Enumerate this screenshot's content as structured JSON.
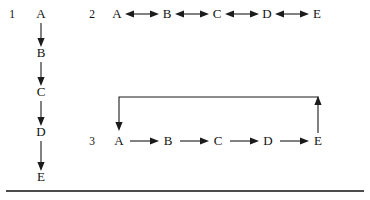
{
  "figure": {
    "background_color": "#ffffff",
    "ink_color": "#1b1b1b",
    "diagrams": [
      {
        "index_label": "1",
        "orientation": "vertical",
        "arrow_style": "single-headed",
        "nodes": [
          "A",
          "B",
          "C",
          "D",
          "E"
        ],
        "edges": [
          {
            "from": "A",
            "to": "B",
            "direction": "down"
          },
          {
            "from": "B",
            "to": "C",
            "direction": "down"
          },
          {
            "from": "C",
            "to": "D",
            "direction": "down"
          },
          {
            "from": "D",
            "to": "E",
            "direction": "down"
          }
        ],
        "feedback_loop": false
      },
      {
        "index_label": "2",
        "orientation": "horizontal",
        "arrow_style": "double-headed",
        "nodes": [
          "A",
          "B",
          "C",
          "D",
          "E"
        ],
        "edges": [
          {
            "from": "A",
            "to": "B",
            "direction": "both"
          },
          {
            "from": "B",
            "to": "C",
            "direction": "both"
          },
          {
            "from": "C",
            "to": "D",
            "direction": "both"
          },
          {
            "from": "D",
            "to": "E",
            "direction": "both"
          }
        ],
        "feedback_loop": false
      },
      {
        "index_label": "3",
        "orientation": "horizontal",
        "arrow_style": "single-headed",
        "nodes": [
          "A",
          "B",
          "C",
          "D",
          "E"
        ],
        "edges": [
          {
            "from": "A",
            "to": "B",
            "direction": "right"
          },
          {
            "from": "B",
            "to": "C",
            "direction": "right"
          },
          {
            "from": "C",
            "to": "D",
            "direction": "right"
          },
          {
            "from": "D",
            "to": "E",
            "direction": "right"
          }
        ],
        "feedback_loop": true,
        "feedback_loop_path": "E up, left across, down into A"
      }
    ],
    "rule": {
      "present": true,
      "position": "bottom",
      "span": "full-width"
    }
  },
  "labels": {
    "d1_index": "1",
    "d1_n0": "A",
    "d1_n1": "B",
    "d1_n2": "C",
    "d1_n3": "D",
    "d1_n4": "E",
    "d2_index": "2",
    "d2_n0": "A",
    "d2_n1": "B",
    "d2_n2": "C",
    "d2_n3": "D",
    "d2_n4": "E",
    "d3_index": "3",
    "d3_n0": "A",
    "d3_n1": "B",
    "d3_n2": "C",
    "d3_n3": "D",
    "d3_n4": "E"
  }
}
